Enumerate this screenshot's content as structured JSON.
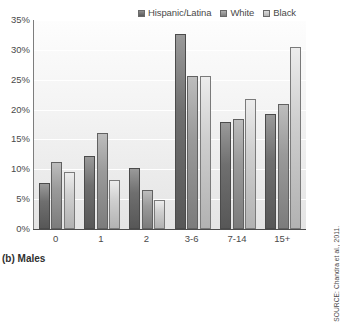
{
  "caption": "(b) Males",
  "source_note": "SOURCE: Chandra et al., 2011.",
  "legend": {
    "entries": [
      {
        "label": "Hispanic/Latina",
        "color": "#6f6f6f"
      },
      {
        "label": "White",
        "color": "#9a9a9a"
      },
      {
        "label": "Black",
        "color": "#cfcfcf"
      }
    ]
  },
  "axes": {
    "y_ticks": [
      "0%",
      "5%",
      "10%",
      "15%",
      "20%",
      "25%",
      "30%",
      "35%"
    ],
    "x_ticks": [
      "0",
      "1",
      "2",
      "3-6",
      "7-14",
      "15+"
    ]
  },
  "chart_data": {
    "type": "bar",
    "title": "(b) Males",
    "xlabel": "",
    "ylabel": "",
    "ylim": [
      0,
      35
    ],
    "ytick_step": 5,
    "grid": true,
    "legend_position": "top-right",
    "annotations": [
      "SOURCE: Chandra et al., 2011."
    ],
    "categories": [
      "0",
      "1",
      "2",
      "3-6",
      "7-14",
      "15+"
    ],
    "series": [
      {
        "name": "Hispanic/Latina",
        "values": [
          7.7,
          12.3,
          10.3,
          32.7,
          17.9,
          19.2
        ]
      },
      {
        "name": "White",
        "values": [
          11.2,
          16.0,
          6.5,
          25.7,
          18.5,
          21.0
        ]
      },
      {
        "name": "Black",
        "values": [
          9.5,
          8.2,
          4.9,
          25.6,
          21.8,
          30.4
        ]
      }
    ]
  }
}
